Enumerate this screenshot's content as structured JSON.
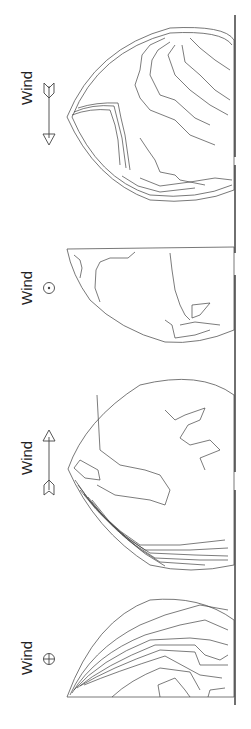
{
  "figure": {
    "panels": [
      {
        "id": "panel-1",
        "wind_label": "Wind",
        "wind_symbol": "arrow-pointing-down",
        "wind_symbol_meaning": "wind from tail to head (left-to-right in rotated frame)"
      },
      {
        "id": "panel-2",
        "wind_label": "Wind",
        "wind_symbol": "circle-dot",
        "wind_symbol_meaning": "wind out of page"
      },
      {
        "id": "panel-3",
        "wind_label": "Wind",
        "wind_symbol": "arrow-pointing-up",
        "wind_symbol_meaning": "wind from tail to head"
      },
      {
        "id": "panel-4",
        "wind_label": "Wind",
        "wind_symbol": "circle-cross",
        "wind_symbol_meaning": "wind into page"
      }
    ],
    "contour_labels_legible": false
  }
}
